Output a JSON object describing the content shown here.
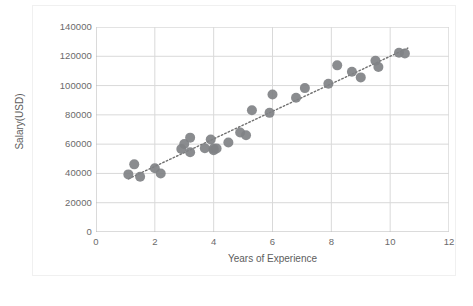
{
  "chart_data": {
    "type": "scatter",
    "title": "",
    "xlabel": "Years of Experience",
    "ylabel": "Salary(USD)",
    "xlim": [
      0,
      12
    ],
    "ylim": [
      0,
      140000
    ],
    "xticks": [
      0,
      2,
      4,
      6,
      8,
      10,
      12
    ],
    "yticks": [
      0,
      20000,
      40000,
      60000,
      80000,
      100000,
      120000,
      140000
    ],
    "xtick_labels": [
      "0",
      "2",
      "4",
      "6",
      "8",
      "10",
      "12"
    ],
    "ytick_labels": [
      "0",
      "20000",
      "40000",
      "60000",
      "80000",
      "100000",
      "120000",
      "140000"
    ],
    "grid": "horizontal-and-vertical",
    "legend": "none",
    "marker_color": "#808285",
    "marker_size": 5.0,
    "trendline": {
      "style": "dotted",
      "color": "#6f6f6f",
      "intercept": 26000,
      "slope": 9400,
      "x_start": 1.1,
      "x_end": 10.6
    },
    "points": [
      {
        "x": 1.1,
        "y": 39343
      },
      {
        "x": 1.3,
        "y": 46205
      },
      {
        "x": 1.5,
        "y": 37731
      },
      {
        "x": 2.0,
        "y": 43525
      },
      {
        "x": 2.2,
        "y": 39891
      },
      {
        "x": 2.9,
        "y": 56642
      },
      {
        "x": 3.0,
        "y": 60150
      },
      {
        "x": 3.2,
        "y": 54445
      },
      {
        "x": 3.2,
        "y": 64445
      },
      {
        "x": 3.7,
        "y": 57189
      },
      {
        "x": 3.9,
        "y": 63218
      },
      {
        "x": 4.0,
        "y": 55794
      },
      {
        "x": 4.0,
        "y": 56957
      },
      {
        "x": 4.1,
        "y": 57081
      },
      {
        "x": 4.5,
        "y": 61111
      },
      {
        "x": 4.9,
        "y": 67938
      },
      {
        "x": 5.1,
        "y": 66029
      },
      {
        "x": 5.3,
        "y": 83088
      },
      {
        "x": 5.9,
        "y": 81363
      },
      {
        "x": 6.0,
        "y": 93940
      },
      {
        "x": 6.8,
        "y": 91738
      },
      {
        "x": 7.1,
        "y": 98273
      },
      {
        "x": 7.9,
        "y": 101302
      },
      {
        "x": 8.2,
        "y": 113812
      },
      {
        "x": 8.7,
        "y": 109431
      },
      {
        "x": 9.0,
        "y": 105582
      },
      {
        "x": 9.5,
        "y": 116969
      },
      {
        "x": 9.6,
        "y": 112635
      },
      {
        "x": 10.3,
        "y": 122391
      },
      {
        "x": 10.5,
        "y": 121872
      }
    ]
  },
  "caption": {
    "text": ""
  }
}
